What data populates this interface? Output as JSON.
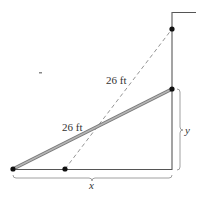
{
  "diagram": {
    "labels": {
      "ladder_top_position": "26 ft",
      "ladder_current": "26 ft",
      "horizontal_distance": "x",
      "vertical_height": "y"
    },
    "colors": {
      "wall": "#555555",
      "ladder": "#8a8a8a",
      "dashed_ladder": "#888888",
      "points": "#111111",
      "text": "#333333"
    }
  }
}
